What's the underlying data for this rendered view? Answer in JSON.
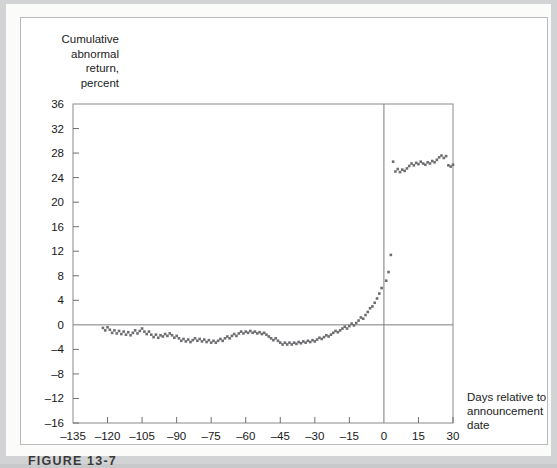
{
  "figure": {
    "caption": "FIGURE 13-7"
  },
  "chart_data": {
    "type": "scatter",
    "title": "",
    "ylabel": "Cumulative\nabnormal\nreturn,\npercent",
    "xlabel_lines": [
      "Days relative to",
      "announcement",
      "date"
    ],
    "xlabel": "Days relative to announcement date",
    "grid": false,
    "legend": "none",
    "marker": "square",
    "marker_color": "#6e6e72",
    "marker_size": 2.6,
    "xlim": [
      -135,
      30
    ],
    "ylim": [
      -16,
      36
    ],
    "xticks": [
      -135,
      -120,
      -105,
      -90,
      -75,
      -60,
      -45,
      -30,
      -15,
      0,
      15,
      30
    ],
    "xtick_labels": [
      "–135",
      "–120",
      "–105",
      "–90",
      "–75",
      "–60",
      "–45",
      "–30",
      "–15",
      "0",
      "15",
      "30"
    ],
    "yticks": [
      -16,
      -12,
      -8,
      -4,
      0,
      4,
      8,
      12,
      16,
      20,
      24,
      28,
      32,
      36
    ],
    "ytick_labels": [
      "–16",
      "–12",
      "–8",
      "–4",
      "0",
      "4",
      "8",
      "12",
      "16",
      "20",
      "24",
      "28",
      "32",
      "36"
    ],
    "zero_line_y": 0,
    "event_line_x": 0,
    "x": [
      -122,
      -121,
      -120,
      -119,
      -118,
      -117,
      -116,
      -115,
      -114,
      -113,
      -112,
      -111,
      -110,
      -109,
      -108,
      -107,
      -106,
      -105,
      -104,
      -103,
      -102,
      -101,
      -100,
      -99,
      -98,
      -97,
      -96,
      -95,
      -94,
      -93,
      -92,
      -91,
      -90,
      -89,
      -88,
      -87,
      -86,
      -85,
      -84,
      -83,
      -82,
      -81,
      -80,
      -79,
      -78,
      -77,
      -76,
      -75,
      -74,
      -73,
      -72,
      -71,
      -70,
      -69,
      -68,
      -67,
      -66,
      -65,
      -64,
      -63,
      -62,
      -61,
      -60,
      -59,
      -58,
      -57,
      -56,
      -55,
      -54,
      -53,
      -52,
      -51,
      -50,
      -49,
      -48,
      -47,
      -46,
      -45,
      -44,
      -43,
      -42,
      -41,
      -40,
      -39,
      -38,
      -37,
      -36,
      -35,
      -34,
      -33,
      -32,
      -31,
      -30,
      -29,
      -28,
      -27,
      -26,
      -25,
      -24,
      -23,
      -22,
      -21,
      -20,
      -19,
      -18,
      -17,
      -16,
      -15,
      -14,
      -13,
      -12,
      -11,
      -10,
      -9,
      -8,
      -7,
      -6,
      -5,
      -4,
      -3,
      -2,
      -1,
      1,
      2,
      3,
      4,
      5,
      6,
      7,
      8,
      9,
      10,
      11,
      12,
      13,
      14,
      15,
      16,
      17,
      18,
      19,
      20,
      21,
      22,
      23,
      24,
      25,
      26,
      27,
      28,
      29,
      30
    ],
    "y": [
      -0.5,
      -0.9,
      -0.4,
      -0.8,
      -1.3,
      -0.9,
      -1.4,
      -1.0,
      -1.5,
      -1.1,
      -1.6,
      -1.2,
      -1.7,
      -1.3,
      -0.9,
      -1.4,
      -1.0,
      -0.6,
      -1.1,
      -1.5,
      -1.1,
      -1.6,
      -2.0,
      -1.6,
      -2.1,
      -1.7,
      -1.9,
      -1.5,
      -1.8,
      -1.4,
      -1.7,
      -2.1,
      -1.8,
      -2.2,
      -2.6,
      -2.3,
      -2.7,
      -2.4,
      -2.8,
      -2.5,
      -2.2,
      -2.6,
      -2.3,
      -2.7,
      -2.4,
      -2.8,
      -2.5,
      -2.9,
      -2.6,
      -2.9,
      -2.6,
      -2.3,
      -2.6,
      -2.2,
      -1.9,
      -2.2,
      -1.8,
      -1.5,
      -1.8,
      -1.4,
      -1.1,
      -1.4,
      -1.1,
      -1.3,
      -1.0,
      -1.3,
      -1.1,
      -1.4,
      -1.2,
      -1.5,
      -1.3,
      -1.6,
      -1.9,
      -2.2,
      -2.5,
      -2.2,
      -2.6,
      -2.9,
      -3.2,
      -2.9,
      -3.2,
      -2.9,
      -3.2,
      -2.9,
      -3.1,
      -2.8,
      -3.0,
      -2.7,
      -2.9,
      -2.6,
      -2.8,
      -2.5,
      -2.7,
      -2.4,
      -2.1,
      -2.3,
      -2.0,
      -1.7,
      -1.9,
      -1.6,
      -1.3,
      -1.0,
      -1.2,
      -0.9,
      -0.6,
      -0.3,
      -0.6,
      -0.2,
      0.2,
      -0.1,
      0.3,
      0.7,
      1.2,
      1.0,
      1.6,
      2.1,
      2.7,
      3.0,
      3.6,
      4.3,
      5.1,
      6.0,
      7.2,
      8.6,
      11.4,
      26.6,
      25.0,
      25.4,
      24.9,
      25.3,
      25.1,
      25.5,
      25.9,
      26.3,
      26.0,
      26.4,
      26.2,
      26.6,
      26.3,
      26.1,
      26.5,
      26.3,
      26.7,
      26.5,
      26.9,
      27.3,
      27.6,
      27.2,
      27.5,
      26.0,
      25.8,
      26.1,
      25.9,
      26.2,
      26.0,
      26.4,
      26.2
    ]
  }
}
